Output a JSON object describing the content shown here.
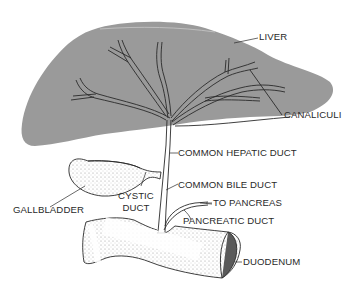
{
  "diagram": {
    "colors": {
      "liver_fill": "#9a9a9a",
      "outline": "#2a2a2a",
      "label_text": "#2a2a2a",
      "background": "#ffffff"
    },
    "labels": {
      "liver": "LIVER",
      "canaliculi": "CANALICULI",
      "common_hepatic_duct": "COMMON HEPATIC DUCT",
      "common_bile_duct": "COMMON BILE DUCT",
      "to_pancreas": "TO PANCREAS",
      "pancreatic_duct": "PANCREATIC DUCT",
      "gallbladder": "GALLBLADDER",
      "cystic_duct_line1": "CYSTIC",
      "cystic_duct_line2": "DUCT",
      "duodenum": "DUODENUM"
    }
  }
}
